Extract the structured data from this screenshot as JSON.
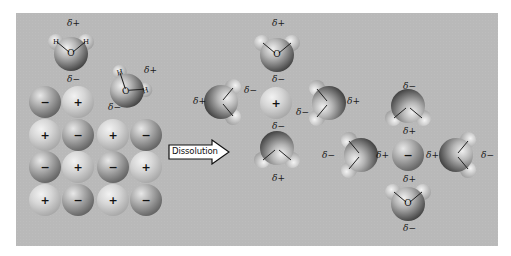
{
  "diagram": {
    "arrow_label": "Dissolution",
    "colors": {
      "background": "#b9b9b9",
      "page": "#ffffff",
      "cation": "#d6d6d6",
      "anion": "#6f6f6f",
      "water": "#9a9a9a"
    },
    "charge_labels": {
      "plus": "+",
      "minus": "−",
      "delta_plus": "δ+",
      "delta_minus": "δ−",
      "oxygen": "O",
      "hydrogen": "H"
    },
    "crystal_lattice": {
      "rows": [
        [
          "−",
          "+"
        ],
        [
          "+",
          "−",
          "+",
          "−"
        ],
        [
          "−",
          "+",
          "−",
          "+"
        ],
        [
          "+",
          "−",
          "+",
          "−"
        ]
      ]
    },
    "free_water_molecules": [
      {
        "position": "top-left",
        "delta_top": "δ+",
        "delta_bottom": "δ−"
      },
      {
        "position": "top-right",
        "delta_side": "δ+",
        "delta_bottom": "δ−"
      }
    ],
    "hydrated_cation": {
      "ion_charge": "+",
      "waters": [
        {
          "position": "top",
          "outer": "δ+",
          "inner": "δ−"
        },
        {
          "position": "left",
          "outer": "δ+",
          "inner": "δ−"
        },
        {
          "position": "right",
          "outer": "δ+",
          "inner": "δ−"
        },
        {
          "position": "bottom",
          "outer": "δ+",
          "inner": "δ−"
        }
      ]
    },
    "hydrated_anion": {
      "ion_charge": "−",
      "waters": [
        {
          "position": "top",
          "outer": "δ−",
          "inner": "δ+"
        },
        {
          "position": "left",
          "outer": "δ−",
          "inner": "δ+"
        },
        {
          "position": "right",
          "outer": "δ−",
          "inner": "δ+"
        },
        {
          "position": "bottom",
          "outer": "δ−",
          "inner": "δ+"
        }
      ]
    }
  }
}
